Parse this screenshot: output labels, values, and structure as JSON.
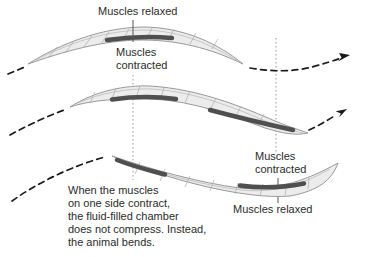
{
  "labels": {
    "muscles_relaxed_top": "Muscles relaxed",
    "muscles_contracted_top": "Muscles\ncontracted",
    "muscles_contracted_bottom": "Muscles\ncontracted",
    "muscles_relaxed_bottom": "Muscles relaxed"
  },
  "caption": {
    "lines": [
      "When the muscles",
      "on one side contract,",
      "the fluid-filled chamber",
      "does not compress. Instead,",
      "the animal bends."
    ]
  },
  "colors": {
    "background": "#ffffff",
    "worm_body_fill": "#ececec",
    "worm_outline": "#999999",
    "contracted_muscle_band": "#4f4f4f",
    "text": "#2b2b2b",
    "guide_line": "#999999",
    "motion_arrow": "#1a1a1a"
  }
}
